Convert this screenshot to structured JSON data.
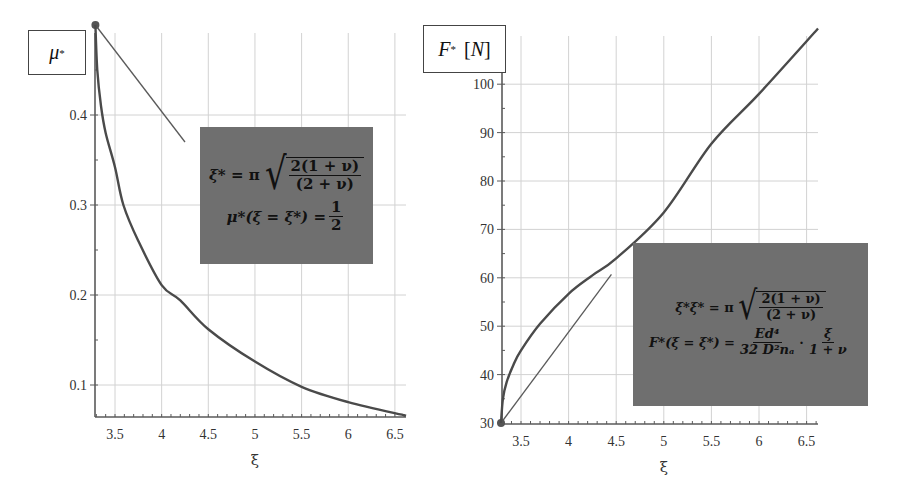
{
  "chart_data": [
    {
      "type": "line",
      "title": "",
      "ylabel": "μ*",
      "xlabel": "ξ",
      "xlim": [
        3.29,
        6.62
      ],
      "ylim": [
        0.066,
        0.5
      ],
      "xticks": [
        3.5,
        4,
        4.5,
        5,
        5.5,
        6,
        6.5
      ],
      "xtick_labels": [
        "3.5",
        "4",
        "4.5",
        "5",
        "5.5",
        "6",
        "6.5"
      ],
      "yticks": [
        0.1,
        0.2,
        0.3,
        0.4
      ],
      "ytick_labels": [
        "0.1",
        "0.2",
        "0.3",
        "0.4"
      ],
      "grid": true,
      "series": [
        {
          "name": "μ*(ξ)",
          "x": [
            3.29,
            3.31,
            3.35,
            3.4,
            3.5,
            3.59,
            3.75,
            4.0,
            4.2,
            4.5,
            5.0,
            5.5,
            6.0,
            6.62
          ],
          "values": [
            0.5,
            0.45,
            0.41,
            0.38,
            0.342,
            0.3,
            0.26,
            0.211,
            0.194,
            0.162,
            0.126,
            0.098,
            0.081,
            0.066
          ]
        }
      ],
      "annotations": [
        {
          "type": "point",
          "x": 3.29,
          "y": 0.5
        },
        {
          "type": "pointer-line",
          "from": [
            3.29,
            0.5
          ],
          "to": [
            4.25,
            0.37
          ]
        }
      ],
      "formula_box": {
        "line1_lhs": "ξ*",
        "line1_eq": "= π",
        "line1_num": "2(1 + ν)",
        "line1_den": "(2 + ν)",
        "line2_lhs": "μ*(ξ = ξ*) =",
        "line2_num": "1",
        "line2_den": "2"
      }
    },
    {
      "type": "line",
      "title": "",
      "ylabel": "F* [N]",
      "xlabel": "ξ",
      "xlim": [
        3.29,
        6.62
      ],
      "ylim": [
        30,
        111.5
      ],
      "xticks": [
        3.5,
        4,
        4.5,
        5,
        5.5,
        6,
        6.5
      ],
      "xtick_labels": [
        "3.5",
        "4",
        "4.5",
        "5",
        "5.5",
        "6",
        "6.5"
      ],
      "yticks": [
        30,
        40,
        50,
        60,
        70,
        80,
        90,
        100
      ],
      "ytick_labels": [
        "30",
        "40",
        "50",
        "60",
        "70",
        "80",
        "90",
        "100"
      ],
      "grid": true,
      "series": [
        {
          "name": "F*(ξ)",
          "x": [
            3.29,
            3.31,
            3.35,
            3.42,
            3.5,
            3.7,
            4.0,
            4.25,
            4.5,
            5.0,
            5.5,
            6.0,
            6.62
          ],
          "values": [
            30,
            35,
            38.5,
            42,
            45,
            50.5,
            56.7,
            60.5,
            64,
            73.5,
            87.7,
            98,
            111.5
          ]
        }
      ],
      "annotations": [
        {
          "type": "point",
          "x": 3.29,
          "y": 30
        },
        {
          "type": "tangent-line",
          "from": [
            3.29,
            30
          ],
          "to": [
            4.45,
            60.7
          ]
        }
      ],
      "formula_box": {
        "line1_lhs": "ξ*ξ*",
        "line1_eq": "= π",
        "line1_num": "2(1 + ν)",
        "line1_den": "(2 + ν)",
        "line2_lhs": "F*(ξ = ξ*) =",
        "line2_num1": "Ed⁴",
        "line2_den1": "32 D²nₐ",
        "line2_dot": "·",
        "line2_num2": "ξ",
        "line2_den2": "1 + ν"
      }
    }
  ],
  "left_chart": {
    "y_label_symbol": "μ",
    "y_label_sup": "*",
    "x_label": "ξ"
  },
  "right_chart": {
    "y_label_symbol": "F",
    "y_label_sup": "*",
    "y_label_unit_open": "[",
    "y_label_unit": "N",
    "y_label_unit_close": "]",
    "x_label": "ξ"
  },
  "colors": {
    "curve": "#4a4a4a",
    "formula_box_bg": "#6f6f6f",
    "grid": "#d2d2d2"
  }
}
